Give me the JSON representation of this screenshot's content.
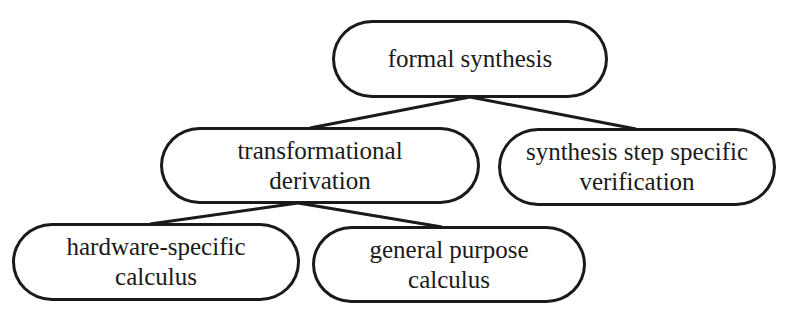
{
  "diagram": {
    "type": "tree",
    "nodes": [
      {
        "id": "root",
        "label": "formal synthesis"
      },
      {
        "id": "deriv",
        "label": "transformational\nderivation"
      },
      {
        "id": "verif",
        "label": "synthesis step specific\nverification"
      },
      {
        "id": "hw",
        "label": "hardware-specific\ncalculus"
      },
      {
        "id": "gp",
        "label": "general purpose\ncalculus"
      }
    ],
    "edges": [
      {
        "from": "root",
        "to": "deriv"
      },
      {
        "from": "root",
        "to": "verif"
      },
      {
        "from": "deriv",
        "to": "hw"
      },
      {
        "from": "deriv",
        "to": "gp"
      }
    ],
    "colors": {
      "stroke": "#1a1a1a",
      "fill": "#ffffff",
      "text": "#1a1a1a"
    }
  }
}
